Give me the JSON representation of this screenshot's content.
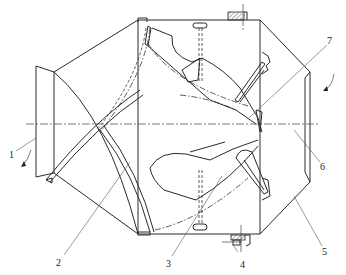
{
  "diagram": {
    "type": "mechanical-cross-section",
    "labels": [
      {
        "id": "1",
        "text": "1"
      },
      {
        "id": "2",
        "text": "2"
      },
      {
        "id": "3",
        "text": "3"
      },
      {
        "id": "4",
        "text": "4"
      },
      {
        "id": "5",
        "text": "5"
      },
      {
        "id": "6",
        "text": "6"
      },
      {
        "id": "7",
        "text": "7"
      }
    ],
    "colors": {
      "line": "#2a2a2a",
      "background": "#ffffff"
    }
  }
}
